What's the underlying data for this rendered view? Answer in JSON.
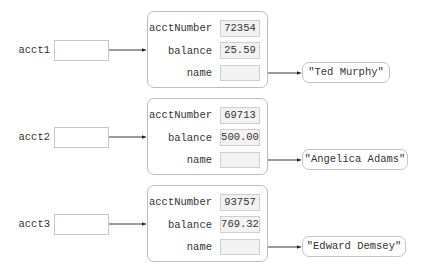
{
  "diagram": {
    "type": "object-reference-diagram",
    "references": [
      {
        "label": "acct1"
      },
      {
        "label": "acct2"
      },
      {
        "label": "acct3"
      }
    ],
    "objects": [
      {
        "fields": [
          {
            "name": "acctNumber",
            "value": "72354"
          },
          {
            "name": "balance",
            "value": "25.59"
          },
          {
            "name": "name",
            "value": ""
          }
        ],
        "string": "\"Ted Murphy\""
      },
      {
        "fields": [
          {
            "name": "acctNumber",
            "value": "69713"
          },
          {
            "name": "balance",
            "value": "500.00"
          },
          {
            "name": "name",
            "value": ""
          }
        ],
        "string": "\"Angelica Adams\""
      },
      {
        "fields": [
          {
            "name": "acctNumber",
            "value": "93757"
          },
          {
            "name": "balance",
            "value": "769.32"
          },
          {
            "name": "name",
            "value": ""
          }
        ],
        "string": "\"Edward Demsey\""
      }
    ],
    "colors": {
      "line": "#222222",
      "cell_fill": "#f2f2f2",
      "border": "#c4c4c4"
    }
  }
}
